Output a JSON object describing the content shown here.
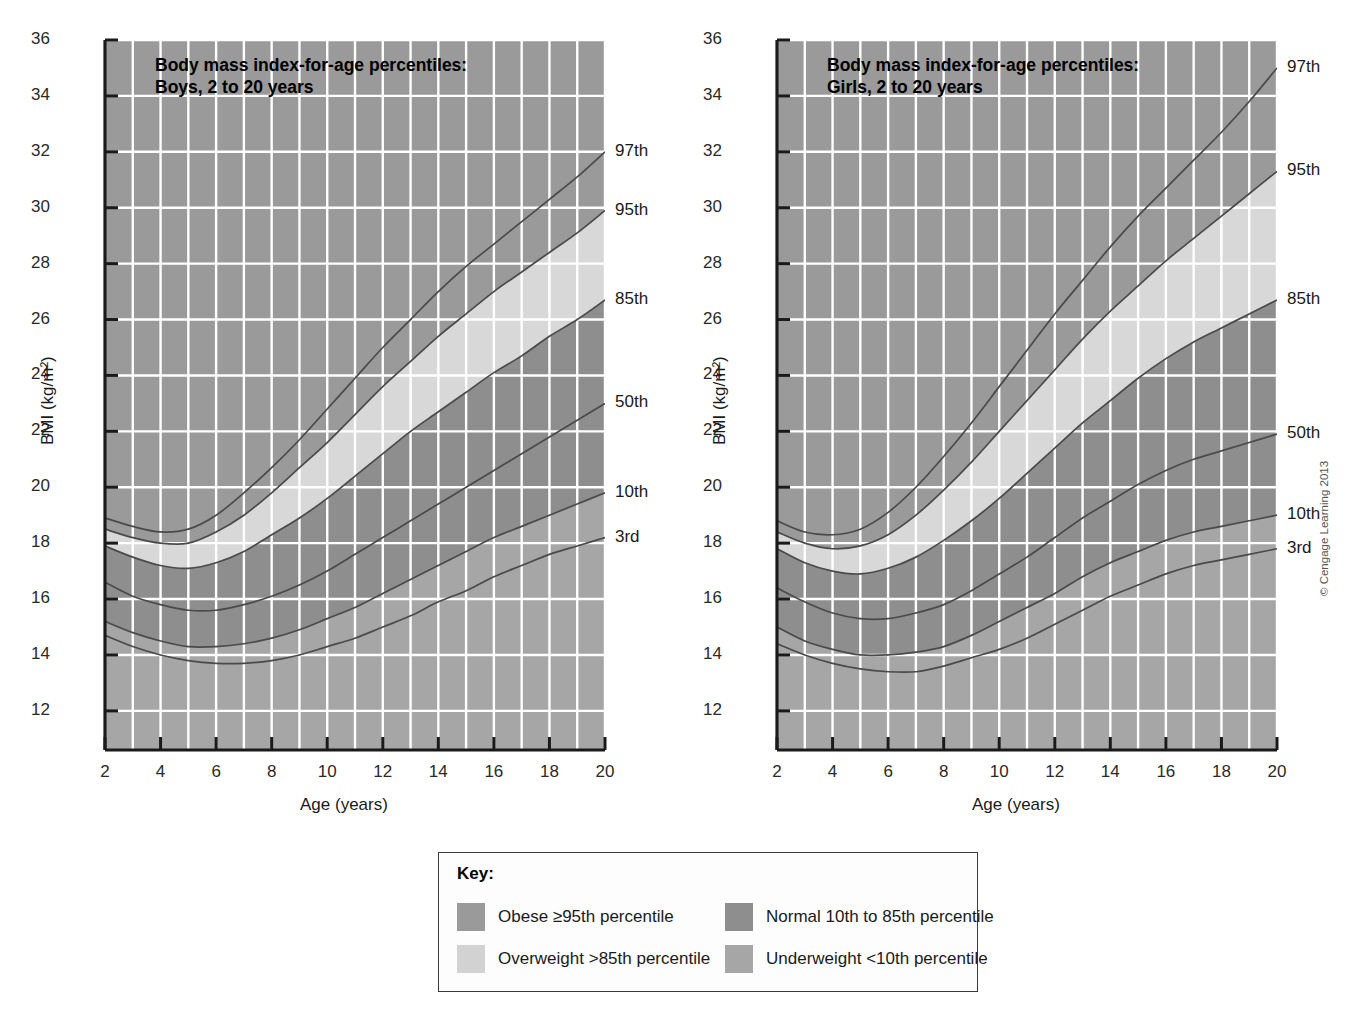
{
  "figure": {
    "copyright": "© Cengage Learning 2013"
  },
  "panels": [
    {
      "id": "boys",
      "title": "Body mass index-for-age percentiles:\nBoys, 2 to 20 years",
      "xlabel": "Age (years)",
      "ylabel": "BMI (kg/m²)"
    },
    {
      "id": "girls",
      "title": "Body mass index-for-age percentiles:\nGirls, 2 to 20 years",
      "xlabel": "Age (years)",
      "ylabel": "BMI (kg/m²)"
    }
  ],
  "key": {
    "title": "Key:",
    "entries": [
      {
        "label": "Obese ≥95th percentile",
        "color": "#9a9a9a"
      },
      {
        "label": "Overweight >85th percentile",
        "color": "#d2d2d2"
      },
      {
        "label": "Normal 10th to 85th percentile",
        "color": "#8e8e8e"
      },
      {
        "label": "Underweight <10th percentile",
        "color": "#a6a6a6"
      }
    ]
  },
  "colors": {
    "plot_background": "#cfcfcf",
    "gridline": "#ffffff",
    "axis": "#1a1a1a",
    "band_obese": "#9a9a9a",
    "band_overweight": "#d8d8d8",
    "band_normal": "#8e8e8e",
    "band_underweight": "#a6a6a6",
    "curve_line": "#4a4a4a",
    "text": "#1a1a1a"
  },
  "chart_data": {
    "type": "line",
    "title": "Body mass index-for-age percentiles",
    "xlabel": "Age (years)",
    "ylabel": "BMI (kg/m2)",
    "xlim": [
      2,
      20
    ],
    "ylim": [
      10.6,
      36
    ],
    "xticks": [
      2,
      4,
      6,
      8,
      10,
      12,
      14,
      16,
      18,
      20
    ],
    "yticks": [
      12,
      14,
      16,
      18,
      20,
      22,
      24,
      26,
      28,
      30,
      32,
      34,
      36
    ],
    "xtick_labels": [
      "2",
      "4",
      "6",
      "8",
      "10",
      "12",
      "14",
      "16",
      "18",
      "20"
    ],
    "ytick_labels": [
      "12",
      "14",
      "16",
      "18",
      "20",
      "22",
      "24",
      "26",
      "28",
      "30",
      "32",
      "34",
      "36"
    ],
    "minor_x_gridlines": true,
    "grid": true,
    "legend_position": "right-of-axes",
    "percentile_labels": [
      "97th",
      "95th",
      "85th",
      "50th",
      "10th",
      "3rd"
    ],
    "x": [
      2,
      3,
      4,
      5,
      6,
      7,
      8,
      9,
      10,
      11,
      12,
      13,
      14,
      15,
      16,
      17,
      18,
      19,
      20
    ],
    "series_boys": [
      {
        "name": "3rd",
        "values": [
          14.7,
          14.3,
          14.0,
          13.8,
          13.7,
          13.7,
          13.8,
          14.0,
          14.3,
          14.6,
          15.0,
          15.4,
          15.9,
          16.3,
          16.8,
          17.2,
          17.6,
          17.9,
          18.2
        ]
      },
      {
        "name": "10th",
        "values": [
          15.2,
          14.8,
          14.5,
          14.3,
          14.3,
          14.4,
          14.6,
          14.9,
          15.3,
          15.7,
          16.2,
          16.7,
          17.2,
          17.7,
          18.2,
          18.6,
          19.0,
          19.4,
          19.8
        ]
      },
      {
        "name": "50th",
        "values": [
          16.6,
          16.1,
          15.8,
          15.6,
          15.6,
          15.8,
          16.1,
          16.5,
          17.0,
          17.6,
          18.2,
          18.8,
          19.4,
          20.0,
          20.6,
          21.2,
          21.8,
          22.4,
          23.0
        ]
      },
      {
        "name": "85th",
        "values": [
          17.9,
          17.5,
          17.2,
          17.1,
          17.3,
          17.7,
          18.3,
          18.9,
          19.6,
          20.4,
          21.2,
          22.0,
          22.7,
          23.4,
          24.1,
          24.7,
          25.4,
          26.0,
          26.7
        ]
      },
      {
        "name": "95th",
        "values": [
          18.5,
          18.2,
          18.0,
          18.0,
          18.4,
          19.0,
          19.8,
          20.7,
          21.6,
          22.6,
          23.6,
          24.5,
          25.4,
          26.2,
          27.0,
          27.7,
          28.4,
          29.1,
          29.9
        ]
      },
      {
        "name": "97th",
        "values": [
          18.9,
          18.6,
          18.4,
          18.5,
          19.0,
          19.8,
          20.7,
          21.7,
          22.8,
          23.9,
          25.0,
          26.0,
          27.0,
          27.9,
          28.7,
          29.5,
          30.3,
          31.1,
          32.0
        ]
      }
    ],
    "series_girls": [
      {
        "name": "3rd",
        "values": [
          14.4,
          14.0,
          13.7,
          13.5,
          13.4,
          13.4,
          13.6,
          13.9,
          14.2,
          14.6,
          15.1,
          15.6,
          16.1,
          16.5,
          16.9,
          17.2,
          17.4,
          17.6,
          17.8
        ]
      },
      {
        "name": "10th",
        "values": [
          15.0,
          14.5,
          14.2,
          14.0,
          14.0,
          14.1,
          14.3,
          14.7,
          15.2,
          15.7,
          16.2,
          16.8,
          17.3,
          17.7,
          18.1,
          18.4,
          18.6,
          18.8,
          19.0
        ]
      },
      {
        "name": "50th",
        "values": [
          16.4,
          15.9,
          15.5,
          15.3,
          15.3,
          15.5,
          15.8,
          16.3,
          16.9,
          17.5,
          18.2,
          18.9,
          19.5,
          20.1,
          20.6,
          21.0,
          21.3,
          21.6,
          21.9
        ]
      },
      {
        "name": "85th",
        "values": [
          17.8,
          17.3,
          17.0,
          16.9,
          17.1,
          17.5,
          18.1,
          18.8,
          19.6,
          20.5,
          21.4,
          22.3,
          23.1,
          23.9,
          24.6,
          25.2,
          25.7,
          26.2,
          26.7
        ]
      },
      {
        "name": "95th",
        "values": [
          18.4,
          18.0,
          17.8,
          17.9,
          18.3,
          19.0,
          19.9,
          20.9,
          22.0,
          23.1,
          24.2,
          25.3,
          26.3,
          27.2,
          28.1,
          28.9,
          29.7,
          30.5,
          31.3
        ]
      },
      {
        "name": "97th",
        "values": [
          18.8,
          18.4,
          18.3,
          18.5,
          19.1,
          20.0,
          21.1,
          22.3,
          23.6,
          24.9,
          26.2,
          27.4,
          28.6,
          29.7,
          30.7,
          31.7,
          32.7,
          33.8,
          35.0
        ]
      }
    ]
  }
}
